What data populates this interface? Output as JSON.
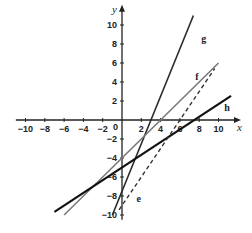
{
  "chart_data": {
    "type": "line",
    "title": "",
    "xlabel": "x",
    "ylabel": "y",
    "xlim": [
      -11,
      11.5
    ],
    "ylim": [
      -10.5,
      11.5
    ],
    "grid": false,
    "x_ticks": [
      -10,
      -8,
      -6,
      -4,
      -2,
      2,
      4,
      6,
      8,
      10
    ],
    "y_ticks": [
      10,
      8,
      6,
      4,
      2,
      -2,
      -4,
      -6,
      -8,
      -10
    ],
    "origin_label": "0",
    "series": [
      {
        "name": "g",
        "style": "solid",
        "color": "#2a2a2a",
        "width": 1.6,
        "slope": 2.5,
        "intercept": -7.5,
        "x_range": [
          -1,
          7.4
        ],
        "label_at": [
          8.2,
          8.2
        ]
      },
      {
        "name": "f",
        "style": "solid",
        "color": "#7a7a7a",
        "width": 1.6,
        "slope": 1,
        "intercept": -4,
        "x_range": [
          -6,
          10
        ],
        "label_at": [
          7.6,
          4.2
        ]
      },
      {
        "name": "h",
        "style": "solid",
        "color": "#111111",
        "width": 2.2,
        "slope": 0.6667,
        "intercept": -5,
        "x_range": [
          -7,
          11.3
        ],
        "label_at": [
          10.6,
          0.9
        ]
      },
      {
        "name": "e",
        "style": "dashed",
        "color": "#333333",
        "width": 1.4,
        "slope": 1.5,
        "intercept": -9,
        "x_range": [
          -0.3,
          9.6
        ],
        "label_at": [
          1.5,
          -8.6
        ]
      }
    ],
    "legend": "inline labels next to each line"
  }
}
